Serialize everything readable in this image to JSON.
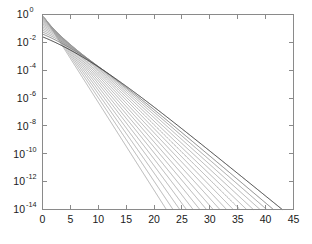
{
  "figure": {
    "background_color": "#ffffff",
    "axes_color": "#8a8a8a",
    "text_color": "#1a1a1a",
    "curve_color": "#808080",
    "curve_dark_color": "#404040"
  },
  "chart_data": {
    "type": "line",
    "title": "",
    "subtitle": "",
    "xlabel": "",
    "ylabel": "",
    "yscale": "log",
    "xscale": "linear",
    "grid": false,
    "legend": false,
    "legend_position": "none",
    "xlim": [
      0,
      45
    ],
    "ylim": [
      1e-14,
      1
    ],
    "xticks": [
      0,
      5,
      10,
      15,
      20,
      25,
      30,
      35,
      40,
      45
    ],
    "xtick_labels": [
      "0",
      "5",
      "10",
      "15",
      "20",
      "25",
      "30",
      "35",
      "40",
      "45"
    ],
    "yticks": [
      1,
      0.01,
      0.0001,
      1e-06,
      1e-08,
      1e-10,
      1e-12,
      1e-14
    ],
    "ytick_labels": [
      {
        "mantissa": "10",
        "exponent": "0"
      },
      {
        "mantissa": "10",
        "exponent": "-2"
      },
      {
        "mantissa": "10",
        "exponent": "-4"
      },
      {
        "mantissa": "10",
        "exponent": "-6"
      },
      {
        "mantissa": "10",
        "exponent": "-8"
      },
      {
        "mantissa": "10",
        "exponent": "-10"
      },
      {
        "mantissa": "10",
        "exponent": "-12"
      },
      {
        "mantissa": "10",
        "exponent": "-14"
      }
    ],
    "series": [
      {
        "name": "curve-01",
        "x_end": 22.2,
        "decay_exponent_per_unit": -0.6306,
        "plateau_x": 0.6,
        "color": "#9a9a9a",
        "width": 0.75
      },
      {
        "name": "curve-02",
        "x_end": 23.4,
        "decay_exponent_per_unit": -0.5983,
        "plateau_x": 1.1,
        "color": "#9a9a9a",
        "width": 0.75
      },
      {
        "name": "curve-03",
        "x_end": 24.6,
        "decay_exponent_per_unit": -0.5691,
        "plateau_x": 1.7,
        "color": "#9a9a9a",
        "width": 0.75
      },
      {
        "name": "curve-04",
        "x_end": 25.8,
        "decay_exponent_per_unit": -0.5426,
        "plateau_x": 2.3,
        "color": "#9a9a9a",
        "width": 0.75
      },
      {
        "name": "curve-05",
        "x_end": 27.0,
        "decay_exponent_per_unit": -0.5185,
        "plateau_x": 3.0,
        "color": "#9a9a9a",
        "width": 0.75
      },
      {
        "name": "curve-06",
        "x_end": 28.2,
        "decay_exponent_per_unit": -0.4965,
        "plateau_x": 3.8,
        "color": "#9a9a9a",
        "width": 0.75
      },
      {
        "name": "curve-07",
        "x_end": 29.4,
        "decay_exponent_per_unit": -0.4762,
        "plateau_x": 4.6,
        "color": "#9a9a9a",
        "width": 0.75
      },
      {
        "name": "curve-08",
        "x_end": 30.6,
        "decay_exponent_per_unit": -0.4575,
        "plateau_x": 5.5,
        "color": "#9a9a9a",
        "width": 0.75
      },
      {
        "name": "curve-09",
        "x_end": 31.8,
        "decay_exponent_per_unit": -0.4403,
        "plateau_x": 6.5,
        "color": "#9a9a9a",
        "width": 0.75
      },
      {
        "name": "curve-10",
        "x_end": 33.0,
        "decay_exponent_per_unit": -0.4242,
        "plateau_x": 7.6,
        "color": "#9a9a9a",
        "width": 0.75
      },
      {
        "name": "curve-11",
        "x_end": 34.2,
        "decay_exponent_per_unit": -0.4094,
        "plateau_x": 8.8,
        "color": "#9a9a9a",
        "width": 0.75
      },
      {
        "name": "curve-12",
        "x_end": 35.4,
        "decay_exponent_per_unit": -0.3955,
        "plateau_x": 10.1,
        "color": "#9a9a9a",
        "width": 0.75
      },
      {
        "name": "curve-13",
        "x_end": 36.6,
        "decay_exponent_per_unit": -0.3825,
        "plateau_x": 11.5,
        "color": "#9a9a9a",
        "width": 0.75
      },
      {
        "name": "curve-14",
        "x_end": 37.8,
        "decay_exponent_per_unit": -0.3704,
        "plateau_x": 13.0,
        "color": "#9a9a9a",
        "width": 0.75
      },
      {
        "name": "curve-15",
        "x_end": 39.0,
        "decay_exponent_per_unit": -0.359,
        "plateau_x": 14.6,
        "color": "#9a9a9a",
        "width": 0.75
      },
      {
        "name": "curve-16",
        "x_end": 40.2,
        "decay_exponent_per_unit": -0.3483,
        "plateau_x": 16.3,
        "color": "#8d8d8d",
        "width": 0.8
      },
      {
        "name": "curve-17",
        "x_end": 41.4,
        "decay_exponent_per_unit": -0.3382,
        "plateau_x": 18.2,
        "color": "#707070",
        "width": 0.85
      },
      {
        "name": "curve-18",
        "x_end": 43.0,
        "decay_exponent_per_unit": -0.3256,
        "plateau_x": 20.8,
        "color": "#3c3c3c",
        "width": 1.0
      }
    ]
  }
}
